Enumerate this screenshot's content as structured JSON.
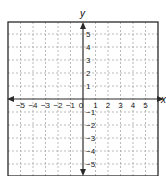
{
  "chart_data": {
    "type": "scatter",
    "title": "",
    "xlabel": "x",
    "ylabel": "y",
    "xlim": [
      -6,
      6
    ],
    "ylim": [
      -6,
      6
    ],
    "grid": true,
    "grid_style": "dashed",
    "x_ticks": [
      -5,
      -4,
      -3,
      -2,
      -1,
      0,
      1,
      2,
      3,
      4,
      5
    ],
    "y_ticks": [
      5,
      4,
      3,
      2,
      1,
      -1,
      -2,
      -3,
      -4,
      -5
    ],
    "x_tick_labels": [
      "−5",
      "−4",
      "−3",
      "−2",
      "−1",
      "0",
      "1",
      "2",
      "3",
      "4",
      "5"
    ],
    "y_tick_labels": [
      "5",
      "4",
      "3",
      "2",
      "1",
      "−1",
      "−2",
      "−3",
      "−4",
      "−5"
    ],
    "series": [],
    "legend": null
  },
  "colors": {
    "frame": "#2a2a2a",
    "axis": "#2a2a2a",
    "grid": "#a8a8a8",
    "background": "#ffffff"
  }
}
